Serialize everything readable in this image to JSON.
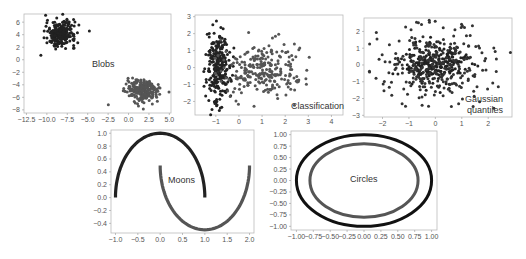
{
  "chart_data": [
    {
      "type": "scatter",
      "title": "Blobs",
      "xlabel": "",
      "ylabel": "",
      "xlim": [
        -12.8,
        5.2
      ],
      "ylim": [
        -8.5,
        7.3
      ],
      "xticks": [
        "-12.5",
        "-10.0",
        "-7.5",
        "-5.0",
        "-2.5",
        "0.0",
        "2.5",
        "5.0"
      ],
      "yticks": [
        "6",
        "4",
        "2",
        "0",
        "-2",
        "-4",
        "-6",
        "-8"
      ],
      "grid": false,
      "series": [
        {
          "name": "class 0",
          "color": "#222222",
          "center": [
            -8.3,
            4.2
          ],
          "spread": [
            0.9,
            1.0
          ],
          "n": 250
        },
        {
          "name": "class 1",
          "color": "#555555",
          "center": [
            1.8,
            -5.0
          ],
          "spread": [
            1.0,
            0.9
          ],
          "n": 250
        }
      ]
    },
    {
      "type": "scatter",
      "title": "Classification",
      "xlabel": "",
      "ylabel": "",
      "xlim": [
        -1.9,
        4.5
      ],
      "ylim": [
        -2.8,
        3.1
      ],
      "xticks": [
        "-1",
        "0",
        "1",
        "2",
        "3",
        "4"
      ],
      "yticks": [
        "3",
        "2",
        "1",
        "0",
        "-1",
        "-2"
      ],
      "grid": false,
      "series": [
        {
          "name": "class 0",
          "color": "#222222",
          "center": [
            -0.9,
            0.1
          ],
          "spread": [
            0.25,
            1.1
          ],
          "n": 250
        },
        {
          "name": "class 1",
          "color": "#555555",
          "center": [
            1.0,
            -0.2
          ],
          "spread": [
            0.9,
            0.75
          ],
          "n": 250
        }
      ]
    },
    {
      "type": "scatter",
      "title": "Gaussian quantiles",
      "xlabel": "",
      "ylabel": "",
      "xlim": [
        -2.7,
        2.9
      ],
      "ylim": [
        -3.1,
        2.8
      ],
      "xticks": [
        "-2",
        "-1",
        "0",
        "1",
        "2"
      ],
      "yticks": [
        "2",
        "1",
        "0",
        "-1",
        "-2",
        "-3"
      ],
      "grid": false,
      "series": [
        {
          "name": "inner",
          "color": "#222222",
          "center": [
            0,
            0.1
          ],
          "spread": [
            0.55,
            0.55
          ],
          "n": 250
        },
        {
          "name": "outer",
          "color": "#333333",
          "center": [
            0,
            0
          ],
          "spread": [
            1.2,
            1.2
          ],
          "n": 250
        }
      ]
    },
    {
      "type": "line",
      "title": "Moons",
      "xlabel": "",
      "ylabel": "",
      "xlim": [
        -1.1,
        2.1
      ],
      "ylim": [
        -0.55,
        1.05
      ],
      "xticks": [
        "-1.0",
        "-0.5",
        "0.0",
        "0.5",
        "1.0",
        "1.5",
        "2.0"
      ],
      "yticks": [
        "1.0",
        "0.8",
        "0.6",
        "0.4",
        "0.2",
        "0.0",
        "-0.2",
        "-0.4"
      ],
      "grid": false,
      "series": [
        {
          "name": "upper moon",
          "color": "#222222",
          "curve": "x=cos(t), y=sin(t), t in [0, pi]"
        },
        {
          "name": "lower moon",
          "color": "#555555",
          "curve": "x=1-cos(t), y=0.5-sin(t), t in [0, pi]"
        }
      ]
    },
    {
      "type": "line",
      "title": "Circles",
      "xlabel": "",
      "ylabel": "",
      "xlim": [
        -1.08,
        1.08
      ],
      "ylim": [
        -1.08,
        1.08
      ],
      "xticks": [
        "-1.00",
        "-0.75",
        "-0.50",
        "-0.25",
        "0.00",
        "0.25",
        "0.50",
        "0.75",
        "1.00"
      ],
      "yticks": [
        "1.00",
        "0.75",
        "0.50",
        "0.25",
        "0.00",
        "-0.25",
        "-0.50",
        "-0.75",
        "-1.00"
      ],
      "grid": false,
      "series": [
        {
          "name": "outer circle",
          "color": "#111111",
          "radius": 1.0
        },
        {
          "name": "inner circle",
          "color": "#555555",
          "radius": 0.8
        }
      ]
    }
  ],
  "panels": {
    "blobs": {
      "label": "Blobs"
    },
    "classification": {
      "label": "Classification"
    },
    "gaussian": {
      "label_line1": "Gaussian",
      "label_line2": "quantiles"
    },
    "moons": {
      "label": "Moons"
    },
    "circles": {
      "label": "Circles"
    }
  }
}
